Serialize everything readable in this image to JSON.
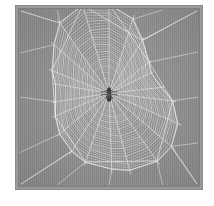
{
  "image": {
    "title": "Spider web with spider at center",
    "subject": "orb-weaver spider web",
    "caption": "",
    "medium": "photograph",
    "frame": {
      "outer_border_color": "#8a8a8a",
      "inner_border_color": "#7e7e7e",
      "page_background": "#ffffff",
      "left": 15,
      "top": 5,
      "width": 188,
      "height": 185
    },
    "palette": {
      "background_gray": "#909090",
      "web_silk": "#e8e8e8",
      "web_silk_dim": "#c9c9c9",
      "anchor_thread": "#f0f0f0",
      "spider_body": "#2b2b2b",
      "spider_leg": "#3a3a3a"
    }
  },
  "web": {
    "type": "orb-web",
    "center": {
      "x": 112,
      "y": 96
    },
    "radial_count": 22,
    "spiral_turn_count": 34,
    "spiral_inner_radius": 7,
    "spiral_outer_radius": 74,
    "frame_vertex_count": 7,
    "anchor_corner_count": 4,
    "description": "Dense concentric capture spiral supported by radial spokes, outer frame threads and corner anchor lines"
  },
  "spider": {
    "present": true,
    "position": {
      "x": 112,
      "y": 97
    },
    "body_length": 13,
    "body_width": 5,
    "leg_count": 8,
    "color": "#2b2b2b",
    "label": "spider"
  }
}
